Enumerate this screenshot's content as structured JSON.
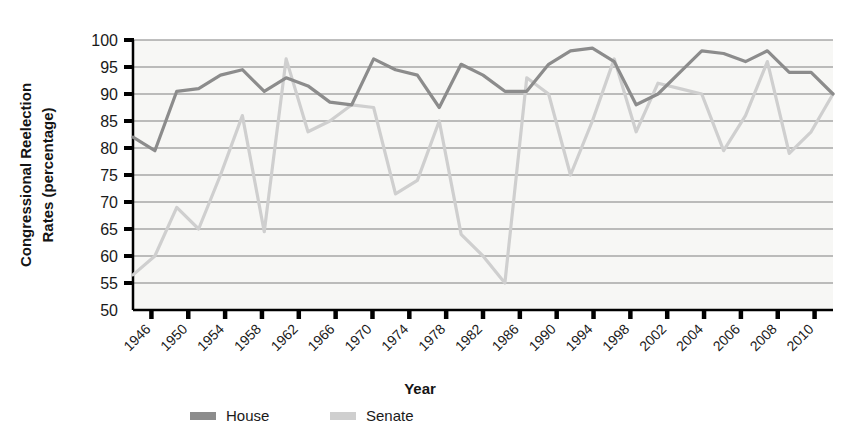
{
  "chart_data": {
    "type": "line",
    "title": "",
    "xlabel": "Year",
    "ylabel": "Congressional Reelection Rates (percentage)",
    "ylabel_lines": [
      "Congressional Reelection",
      "Rates (percentage)"
    ],
    "ylim": [
      50,
      100
    ],
    "ytick_labels": [
      "50",
      "55",
      "60",
      "65",
      "70",
      "75",
      "80",
      "85",
      "90",
      "95",
      "100"
    ],
    "yticks": [
      50,
      55,
      60,
      65,
      70,
      75,
      80,
      85,
      90,
      95,
      100
    ],
    "grid": true,
    "legend_position": "bottom",
    "xtick_labels": [
      "1946",
      "1950",
      "1954",
      "1958",
      "1962",
      "1966",
      "1970",
      "1974",
      "1978",
      "1982",
      "1986",
      "1990",
      "1994",
      "1998",
      "2002",
      "2004",
      "2006",
      "2008",
      "2010"
    ],
    "x": [
      1946,
      1948,
      1950,
      1952,
      1954,
      1956,
      1958,
      1960,
      1962,
      1964,
      1966,
      1968,
      1970,
      1972,
      1974,
      1976,
      1978,
      1980,
      1982,
      1984,
      1986,
      1988,
      1990,
      1992,
      1994,
      1996,
      1998,
      2000,
      2002,
      2004,
      2006,
      2008,
      2010
    ],
    "series": [
      {
        "name": "House",
        "color": "#8c8c8c",
        "values": [
          82,
          79.5,
          90.5,
          91,
          93.5,
          94.5,
          90.5,
          93,
          91.5,
          88.5,
          88,
          96.5,
          94.5,
          93.5,
          87.5,
          95.5,
          93.5,
          90.5,
          90.5,
          95.5,
          98,
          98.5,
          96,
          88,
          90,
          94,
          98,
          97.5,
          96,
          98,
          94,
          94,
          90
        ]
      },
      {
        "name": "Senate",
        "color": "#cfcfcf",
        "values": [
          56.5,
          60,
          69,
          65,
          75,
          86,
          64.5,
          96.5,
          83,
          85,
          88,
          87.5,
          71.5,
          74,
          85,
          64,
          60,
          55,
          93,
          90,
          75,
          85,
          96.5,
          83,
          92,
          91,
          90,
          79.5,
          86,
          96,
          79,
          83,
          90
        ]
      }
    ]
  },
  "legend": [
    {
      "label": "House",
      "color": "#8c8c8c"
    },
    {
      "label": "Senate",
      "color": "#cfcfcf"
    }
  ],
  "axes": {
    "x_title": "Year",
    "y_title_line1": "Congressional Reelection",
    "y_title_line2": "Rates (percentage)"
  },
  "style": {
    "plot_bg": "#f7f7f5",
    "grid_color": "#808080",
    "axis_color": "#000000",
    "house_color": "#8c8c8c",
    "senate_color": "#cfcfcf"
  }
}
